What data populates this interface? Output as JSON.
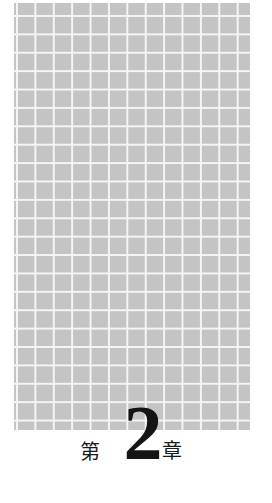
{
  "page": {
    "background_color": "#ffffff"
  },
  "grid_panel": {
    "cell_color": "#c4c4c4",
    "line_color": "#f5f5f5"
  },
  "chapter_heading": {
    "prefix": "第",
    "number": "2",
    "suffix": "章",
    "full_text": "第 2 章",
    "text_color": "#1a1a1a"
  }
}
